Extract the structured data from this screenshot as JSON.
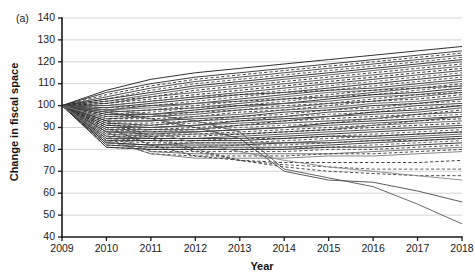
{
  "figure": {
    "panel_label": "(a)",
    "title": "",
    "background": "#ffffff"
  },
  "chart_data": {
    "type": "line",
    "title": "",
    "subtitle": "",
    "xlabel": "Year",
    "ylabel": "Change in fiscal space",
    "xlim": [
      2009,
      2018
    ],
    "ylim": [
      40,
      140
    ],
    "xticks": [
      2009,
      2010,
      2011,
      2012,
      2013,
      2014,
      2015,
      2016,
      2017,
      2018
    ],
    "yticks": [
      40,
      50,
      60,
      70,
      80,
      90,
      100,
      110,
      120,
      130,
      140
    ],
    "xtick_labels": [
      "2009",
      "2010",
      "2011",
      "2012",
      "2013",
      "2014",
      "2015",
      "2016",
      "2017",
      "2018"
    ],
    "ytick_labels": [
      "40",
      "50",
      "60",
      "70",
      "80",
      "90",
      "100",
      "110",
      "120",
      "130",
      "140"
    ],
    "grid": "horizontal",
    "grid_color": "#c9c9c9",
    "legend": "none",
    "legend_position": "none",
    "annotations": [],
    "normalization_note": "all series indexed to 100 in 2009",
    "x": [
      2009,
      2010,
      2011,
      2012,
      2013,
      2014,
      2015,
      2016,
      2017,
      2018
    ],
    "series": [
      {
        "name": "s01",
        "style": "solid",
        "color": "#1b1b1b",
        "width": 0.9,
        "values": [
          100,
          107,
          112,
          115,
          117,
          119,
          121,
          123,
          125,
          127
        ]
      },
      {
        "name": "s02",
        "style": "solid",
        "color": "#2b2b2b",
        "width": 0.9,
        "values": [
          100,
          106,
          110,
          113,
          115,
          117,
          119,
          121,
          123,
          125
        ]
      },
      {
        "name": "s03",
        "style": "dashed",
        "color": "#333333",
        "width": 0.9,
        "values": [
          100,
          105,
          109,
          112,
          114,
          116,
          118,
          120,
          122,
          124
        ]
      },
      {
        "name": "s04",
        "style": "solid",
        "color": "#3d3d3d",
        "width": 0.9,
        "values": [
          100,
          104,
          108,
          111,
          113,
          115,
          117,
          119,
          121,
          123
        ]
      },
      {
        "name": "s05",
        "style": "dashed",
        "color": "#4a4a4a",
        "width": 0.9,
        "values": [
          100,
          103,
          107,
          110,
          112,
          114,
          116,
          118,
          120,
          122
        ]
      },
      {
        "name": "s06",
        "style": "solid",
        "color": "#222222",
        "width": 0.9,
        "values": [
          100,
          103,
          106,
          109,
          111,
          113,
          115,
          117,
          119,
          121
        ]
      },
      {
        "name": "s07",
        "style": "solid",
        "color": "#555555",
        "width": 0.9,
        "values": [
          100,
          102,
          105,
          108,
          110,
          112,
          114,
          116,
          118,
          120
        ]
      },
      {
        "name": "s08",
        "style": "dashed",
        "color": "#2e2e2e",
        "width": 0.9,
        "values": [
          100,
          102,
          104,
          107,
          109,
          111,
          113,
          115,
          117,
          119
        ]
      },
      {
        "name": "s09",
        "style": "solid",
        "color": "#4f4f4f",
        "width": 0.9,
        "values": [
          100,
          101,
          104,
          106,
          108,
          110,
          112,
          114,
          116,
          118
        ]
      },
      {
        "name": "s10",
        "style": "dashed",
        "color": "#1f1f1f",
        "width": 0.9,
        "values": [
          100,
          101,
          103,
          105,
          107,
          109,
          111,
          113,
          115,
          117
        ]
      },
      {
        "name": "s11",
        "style": "solid",
        "color": "#3a3a3a",
        "width": 0.9,
        "values": [
          100,
          100,
          102,
          104,
          106,
          108,
          110,
          112,
          114,
          116
        ]
      },
      {
        "name": "s12",
        "style": "dashed",
        "color": "#565656",
        "width": 0.9,
        "values": [
          100,
          100,
          102,
          104,
          105,
          107,
          109,
          111,
          113,
          115
        ]
      },
      {
        "name": "s13",
        "style": "solid",
        "color": "#262626",
        "width": 0.9,
        "values": [
          100,
          99,
          101,
          103,
          105,
          106,
          108,
          110,
          112,
          114
        ]
      },
      {
        "name": "s14",
        "style": "dashed",
        "color": "#454545",
        "width": 0.9,
        "values": [
          100,
          99,
          100,
          102,
          104,
          106,
          107,
          109,
          111,
          113
        ]
      },
      {
        "name": "s15",
        "style": "solid",
        "color": "#333333",
        "width": 0.9,
        "values": [
          100,
          98,
          100,
          101,
          103,
          105,
          107,
          108,
          110,
          112
        ]
      },
      {
        "name": "s16",
        "style": "solid",
        "color": "#606060",
        "width": 0.9,
        "values": [
          100,
          98,
          99,
          101,
          102,
          104,
          106,
          107,
          109,
          111
        ]
      },
      {
        "name": "s17",
        "style": "dashed",
        "color": "#2a2a2a",
        "width": 0.9,
        "values": [
          100,
          97,
          98,
          100,
          102,
          103,
          105,
          107,
          108,
          110
        ]
      },
      {
        "name": "s18",
        "style": "solid",
        "color": "#3f3f3f",
        "width": 0.9,
        "values": [
          100,
          97,
          98,
          99,
          101,
          103,
          104,
          106,
          108,
          109
        ]
      },
      {
        "name": "s19",
        "style": "dashed",
        "color": "#4d4d4d",
        "width": 0.9,
        "values": [
          100,
          96,
          97,
          99,
          100,
          102,
          104,
          105,
          107,
          109
        ]
      },
      {
        "name": "s20",
        "style": "solid",
        "color": "#1e1e1e",
        "width": 0.9,
        "values": [
          100,
          96,
          96,
          98,
          100,
          101,
          103,
          105,
          106,
          108
        ]
      },
      {
        "name": "s21",
        "style": "solid",
        "color": "#555555",
        "width": 0.9,
        "values": [
          100,
          95,
          96,
          97,
          99,
          101,
          102,
          104,
          105,
          107
        ]
      },
      {
        "name": "s22",
        "style": "dashed",
        "color": "#313131",
        "width": 0.9,
        "values": [
          100,
          95,
          95,
          97,
          98,
          100,
          101,
          103,
          105,
          106
        ]
      },
      {
        "name": "s23",
        "style": "solid",
        "color": "#484848",
        "width": 0.9,
        "values": [
          100,
          94,
          95,
          96,
          98,
          99,
          101,
          102,
          104,
          106
        ]
      },
      {
        "name": "s24",
        "style": "dashed",
        "color": "#232323",
        "width": 0.9,
        "values": [
          100,
          94,
          94,
          95,
          97,
          98,
          100,
          102,
          103,
          105
        ]
      },
      {
        "name": "s25",
        "style": "solid",
        "color": "#5a5a5a",
        "width": 0.9,
        "values": [
          100,
          93,
          93,
          95,
          96,
          98,
          99,
          101,
          102,
          104
        ]
      },
      {
        "name": "s26",
        "style": "solid",
        "color": "#2c2c2c",
        "width": 0.9,
        "values": [
          100,
          93,
          93,
          94,
          95,
          97,
          98,
          100,
          101,
          103
        ]
      },
      {
        "name": "s27",
        "style": "dashed",
        "color": "#414141",
        "width": 0.9,
        "values": [
          100,
          92,
          92,
          93,
          95,
          96,
          98,
          99,
          101,
          102
        ]
      },
      {
        "name": "s28",
        "style": "solid",
        "color": "#363636",
        "width": 0.9,
        "values": [
          100,
          92,
          91,
          93,
          94,
          95,
          97,
          98,
          100,
          101
        ]
      },
      {
        "name": "s29",
        "style": "dashed",
        "color": "#515151",
        "width": 0.9,
        "values": [
          100,
          91,
          91,
          92,
          93,
          95,
          96,
          97,
          99,
          100
        ]
      },
      {
        "name": "s30",
        "style": "solid",
        "color": "#202020",
        "width": 0.9,
        "values": [
          100,
          91,
          90,
          91,
          93,
          94,
          95,
          97,
          98,
          100
        ]
      },
      {
        "name": "s31",
        "style": "solid",
        "color": "#4b4b4b",
        "width": 0.9,
        "values": [
          100,
          90,
          90,
          91,
          92,
          93,
          95,
          96,
          97,
          99
        ]
      },
      {
        "name": "s32",
        "style": "dashed",
        "color": "#2f2f2f",
        "width": 0.9,
        "values": [
          100,
          90,
          89,
          90,
          91,
          93,
          94,
          95,
          96,
          98
        ]
      },
      {
        "name": "s33",
        "style": "solid",
        "color": "#3b3b3b",
        "width": 0.9,
        "values": [
          100,
          89,
          89,
          89,
          91,
          92,
          93,
          94,
          96,
          97
        ]
      },
      {
        "name": "s34",
        "style": "dashed",
        "color": "#585858",
        "width": 0.9,
        "values": [
          100,
          89,
          88,
          89,
          90,
          91,
          92,
          94,
          95,
          96
        ]
      },
      {
        "name": "s35",
        "style": "solid",
        "color": "#272727",
        "width": 0.9,
        "values": [
          100,
          88,
          88,
          88,
          89,
          90,
          92,
          93,
          94,
          95
        ]
      },
      {
        "name": "s36",
        "style": "solid",
        "color": "#464646",
        "width": 0.9,
        "values": [
          100,
          88,
          87,
          88,
          89,
          90,
          91,
          92,
          93,
          95
        ]
      },
      {
        "name": "s37",
        "style": "dashed",
        "color": "#343434",
        "width": 0.9,
        "values": [
          100,
          87,
          87,
          87,
          88,
          89,
          90,
          91,
          93,
          94
        ]
      },
      {
        "name": "s38",
        "style": "solid",
        "color": "#5c5c5c",
        "width": 0.9,
        "values": [
          100,
          87,
          86,
          87,
          87,
          88,
          89,
          91,
          92,
          93
        ]
      },
      {
        "name": "s39",
        "style": "dashed",
        "color": "#242424",
        "width": 0.9,
        "values": [
          100,
          86,
          86,
          86,
          87,
          88,
          89,
          90,
          91,
          92
        ]
      },
      {
        "name": "s40",
        "style": "solid",
        "color": "#434343",
        "width": 0.9,
        "values": [
          100,
          86,
          85,
          85,
          86,
          87,
          88,
          89,
          90,
          91
        ]
      },
      {
        "name": "s41",
        "style": "solid",
        "color": "#303030",
        "width": 0.9,
        "values": [
          100,
          85,
          85,
          85,
          85,
          86,
          87,
          88,
          89,
          90
        ]
      },
      {
        "name": "s42",
        "style": "dashed",
        "color": "#505050",
        "width": 0.9,
        "values": [
          100,
          85,
          84,
          84,
          85,
          85,
          86,
          87,
          88,
          89
        ]
      },
      {
        "name": "s43",
        "style": "solid",
        "color": "#1d1d1d",
        "width": 0.9,
        "values": [
          100,
          84,
          84,
          84,
          84,
          85,
          86,
          86,
          87,
          88
        ]
      },
      {
        "name": "s44",
        "style": "dashed",
        "color": "#3e3e3e",
        "width": 0.9,
        "values": [
          100,
          84,
          83,
          83,
          83,
          84,
          85,
          86,
          87,
          88
        ]
      },
      {
        "name": "s45",
        "style": "solid",
        "color": "#545454",
        "width": 0.9,
        "values": [
          100,
          83,
          82,
          83,
          83,
          83,
          84,
          85,
          86,
          87
        ]
      },
      {
        "name": "s46",
        "style": "solid",
        "color": "#292929",
        "width": 0.9,
        "values": [
          100,
          83,
          82,
          82,
          82,
          83,
          83,
          84,
          85,
          86
        ]
      },
      {
        "name": "s47",
        "style": "dashed",
        "color": "#474747",
        "width": 0.9,
        "values": [
          100,
          82,
          81,
          81,
          82,
          82,
          83,
          84,
          84,
          85
        ]
      },
      {
        "name": "s48",
        "style": "solid",
        "color": "#353535",
        "width": 0.9,
        "values": [
          100,
          82,
          81,
          81,
          81,
          81,
          82,
          83,
          84,
          85
        ]
      },
      {
        "name": "s49",
        "style": "dashed",
        "color": "#5e5e5e",
        "width": 0.9,
        "values": [
          100,
          81,
          80,
          80,
          80,
          81,
          81,
          82,
          83,
          84
        ]
      },
      {
        "name": "s50",
        "style": "solid",
        "color": "#212121",
        "width": 0.9,
        "values": [
          100,
          81,
          80,
          80,
          80,
          80,
          81,
          81,
          82,
          83
        ]
      },
      {
        "name": "s51",
        "style": "dashed",
        "color": "#444444",
        "width": 0.9,
        "values": [
          100,
          88,
          79,
          79,
          79,
          79,
          80,
          80,
          81,
          82
        ]
      },
      {
        "name": "s52",
        "style": "solid",
        "color": "#6a6a6a",
        "width": 0.9,
        "values": [
          100,
          86,
          79,
          78,
          78,
          78,
          78,
          79,
          80,
          81
        ]
      },
      {
        "name": "s53",
        "style": "dashed",
        "color": "#3c3c3c",
        "width": 0.9,
        "values": [
          100,
          85,
          78,
          77,
          77,
          77,
          78,
          78,
          79,
          80
        ]
      },
      {
        "name": "s54",
        "style": "solid",
        "color": "#787878",
        "width": 0.9,
        "values": [
          100,
          84,
          78,
          76,
          76,
          76,
          77,
          77,
          78,
          79
        ]
      },
      {
        "name": "s55",
        "style": "dashed",
        "color": "#2d2d2d",
        "width": 0.9,
        "values": [
          100,
          90,
          82,
          77,
          75,
          74,
          74,
          74,
          74,
          75
        ]
      },
      {
        "name": "s56",
        "style": "dashed",
        "color": "#4e4e4e",
        "width": 0.9,
        "values": [
          100,
          92,
          85,
          79,
          75,
          73,
          72,
          71,
          71,
          71
        ]
      },
      {
        "name": "s57",
        "style": "dashed",
        "color": "#3a3a3a",
        "width": 0.9,
        "values": [
          100,
          93,
          86,
          80,
          75,
          72,
          70,
          69,
          68,
          68
        ]
      },
      {
        "name": "s58",
        "style": "solid",
        "color": "#858585",
        "width": 0.9,
        "values": [
          100,
          94,
          88,
          83,
          79,
          75,
          72,
          70,
          68,
          66
        ]
      },
      {
        "name": "s59",
        "style": "solid",
        "color": "#4a4a4a",
        "width": 0.9,
        "values": [
          100,
          97,
          94,
          90,
          85,
          70,
          66,
          65,
          61,
          56
        ]
      },
      {
        "name": "s60",
        "style": "solid",
        "color": "#565656",
        "width": 0.9,
        "values": [
          100,
          98,
          96,
          93,
          88,
          71,
          67,
          63,
          55,
          46
        ]
      }
    ]
  }
}
